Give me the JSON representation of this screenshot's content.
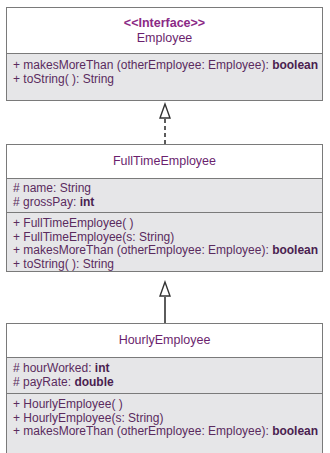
{
  "classes": [
    {
      "id": "employee",
      "stereotype": "<<Interface>>",
      "name": "Employee",
      "attributes": [],
      "methods": [
        {
          "text": "+ makesMoreThan (otherEmployee: Employee): ",
          "type": "boolean"
        },
        {
          "text": "+ toString( ): String",
          "type": ""
        }
      ]
    },
    {
      "id": "fulltime",
      "name": "FullTimeEmployee",
      "attributes": [
        {
          "text": "# name: String",
          "type": ""
        },
        {
          "text": "# grossPay: ",
          "type": "int"
        }
      ],
      "methods": [
        {
          "text": "+ FullTimeEmployee( )",
          "type": ""
        },
        {
          "text": "+ FullTimeEmployee(s: String)",
          "type": ""
        },
        {
          "text": "+ makesMoreThan (otherEmployee: Employee): ",
          "type": "boolean"
        },
        {
          "text": "+ toString( ): String",
          "type": ""
        }
      ]
    },
    {
      "id": "hourly",
      "name": "HourlyEmployee",
      "attributes": [
        {
          "text": "# hourWorked: ",
          "type": "int"
        },
        {
          "text": "# payRate: ",
          "type": "double"
        }
      ],
      "methods": [
        {
          "text": "+ HourlyEmployee( )",
          "type": ""
        },
        {
          "text": "+ HourlyEmployee(s: String)",
          "type": ""
        },
        {
          "text": "+ makesMoreThan (otherEmployee: Employee): ",
          "type": "boolean"
        }
      ]
    }
  ],
  "relations": [
    {
      "from": "FullTimeEmployee",
      "to": "Employee",
      "kind": "realization"
    },
    {
      "from": "HourlyEmployee",
      "to": "FullTimeEmployee",
      "kind": "generalization"
    }
  ],
  "colors": {
    "text": "#5a2b5e",
    "title": "#6b1f6e",
    "box_fill": "#e6e6e8",
    "border": "#7a7a7a"
  }
}
